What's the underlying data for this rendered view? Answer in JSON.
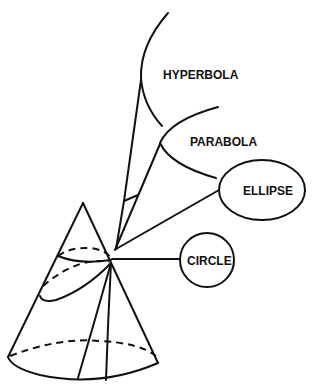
{
  "diagram": {
    "colors": {
      "line": "#111111",
      "background": "#ffffff"
    },
    "labels": {
      "hyperbola": "HYPERBOLA",
      "parabola": "PARABOLA",
      "ellipse": "ELLIPSE",
      "circle": "CIRCLE"
    },
    "nodes": [
      {
        "id": "cone",
        "type": "cone-with-cutting-planes"
      },
      {
        "id": "hyperbola",
        "label": "HYPERBOLA",
        "shape": "hyperbola-curve"
      },
      {
        "id": "parabola",
        "label": "PARABOLA",
        "shape": "parabola-curve"
      },
      {
        "id": "ellipse",
        "label": "ELLIPSE",
        "shape": "ellipse"
      },
      {
        "id": "circle",
        "label": "CIRCLE",
        "shape": "circle"
      }
    ],
    "edges": [
      {
        "from": "cone",
        "to": "hyperbola"
      },
      {
        "from": "cone",
        "to": "parabola"
      },
      {
        "from": "cone",
        "to": "ellipse"
      },
      {
        "from": "cone",
        "to": "circle"
      }
    ]
  }
}
